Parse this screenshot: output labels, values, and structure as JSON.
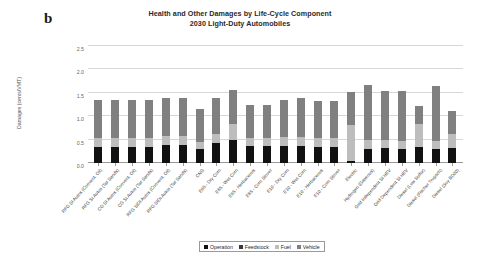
{
  "panel_letter": "b",
  "title": {
    "line1": "Health and Other Damages by Life-Cycle Component",
    "line2": "2030 Light-Duty Automobiles"
  },
  "ylabel": "Damages (cents/VMT)",
  "legend": [
    {
      "label": "Operation",
      "color": "#111111",
      "key": "operation"
    },
    {
      "label": "Feedstock",
      "color": "#3a3a3a",
      "key": "feedstock"
    },
    {
      "label": "Fuel",
      "color": "#bdbdbd",
      "key": "fuel"
    },
    {
      "label": "Vehicle",
      "color": "#808080",
      "key": "vehicle"
    }
  ],
  "chart_data": {
    "type": "bar",
    "stacked": true,
    "title": "Health and Other Damages by Life-Cycle Component 2030 Light-Duty Automobiles",
    "xlabel": "",
    "ylabel": "Damages (cents/VMT)",
    "ylim": [
      0,
      2.5
    ],
    "yticks": [
      "0.0",
      "0.5",
      "1.0",
      "1.5",
      "2.0",
      "2.5"
    ],
    "ytick_values": [
      0.0,
      0.5,
      1.0,
      1.5,
      2.0,
      2.5
    ],
    "grid": true,
    "legend_position": "bottom",
    "categories": [
      "RFG SI Autos (Convent. Oil)",
      "RFG SI Autos (Tar Sands)",
      "CG SI Autos (Convent. Oil)",
      "CG SI Autos (Tar Sands)",
      "RFG SIDI Autos (Convent. Oil)",
      "RFG SIDI Autos (Tar Sands)",
      "CNG",
      "E85 - Dry Corn",
      "E85 - Wet Corn",
      "E85 - Herbaceous",
      "E85 - Corn Stover",
      "E10 - Dry Corn",
      "E10 - Wet Corn",
      "E10 - Herbaceous",
      "E10 - Corn Stover",
      "Electric",
      "Hydrogen (Gaseous)",
      "Grid Independent SI HEV",
      "Grid Dependent SI HEV",
      "Diesel (Low Sulfur)",
      "Diesel (Fischer Tropsch)",
      "Diesel (Soy BD20)"
    ],
    "series": [
      {
        "name": "Operation",
        "color": "#111111",
        "values": [
          0.35,
          0.35,
          0.35,
          0.35,
          0.38,
          0.38,
          0.31,
          0.43,
          0.49,
          0.36,
          0.36,
          0.36,
          0.36,
          0.35,
          0.35,
          0.04,
          0.29,
          0.33,
          0.31,
          0.35,
          0.29,
          0.33
        ]
      },
      {
        "name": "Feedstock",
        "color": "#3a3a3a",
        "values": [
          0.0,
          0.0,
          0.0,
          0.0,
          0.0,
          0.0,
          0.0,
          0.0,
          0.0,
          0.0,
          0.0,
          0.0,
          0.0,
          0.0,
          0.0,
          0.0,
          0.0,
          0.0,
          0.0,
          0.0,
          0.0,
          0.0
        ]
      },
      {
        "name": "Fuel",
        "color": "#bdbdbd",
        "values": [
          0.19,
          0.19,
          0.19,
          0.19,
          0.19,
          0.19,
          0.13,
          0.19,
          0.35,
          0.17,
          0.17,
          0.2,
          0.2,
          0.19,
          0.19,
          0.78,
          0.21,
          0.17,
          0.17,
          0.48,
          0.19,
          0.3
        ]
      },
      {
        "name": "Vehicle",
        "color": "#808080",
        "values": [
          0.81,
          0.81,
          0.81,
          0.81,
          0.81,
          0.81,
          0.72,
          0.76,
          0.71,
          0.72,
          0.7,
          0.79,
          0.82,
          0.78,
          0.78,
          0.7,
          1.17,
          1.03,
          1.05,
          0.39,
          1.17,
          0.48
        ]
      }
    ],
    "totals": [
      1.35,
      1.35,
      1.35,
      1.35,
      1.38,
      1.38,
      1.16,
      1.38,
      1.55,
      1.25,
      1.23,
      1.35,
      1.38,
      1.32,
      1.32,
      1.52,
      1.67,
      1.53,
      1.53,
      1.22,
      1.65,
      1.11
    ]
  }
}
